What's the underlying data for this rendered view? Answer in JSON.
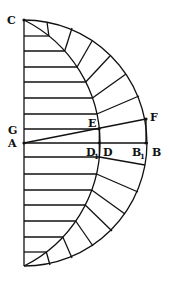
{
  "diagram": {
    "labels": {
      "C": "C",
      "G": "G",
      "A": "A",
      "E": "E",
      "F": "F",
      "D1": "D",
      "D1_sub": "1",
      "D": "D",
      "B1": "B",
      "B1_sub": "1",
      "B": "B"
    },
    "points": {
      "A": [
        24,
        143
      ],
      "C": [
        24,
        20
      ],
      "bottom": [
        24,
        266
      ],
      "B": [
        148,
        143
      ],
      "B1": [
        146,
        143
      ],
      "D": [
        100,
        143
      ],
      "D1": [
        99,
        143
      ],
      "E": [
        99,
        129
      ],
      "F": [
        146,
        119
      ],
      "G": [
        24,
        129
      ]
    },
    "horizontal_lines_top_y": [
      36,
      51,
      67,
      82,
      98,
      114,
      129
    ],
    "horizontal_lines_bottom_y": [
      157,
      174,
      190,
      205,
      221,
      237,
      252
    ],
    "outer_arc": {
      "center": [
        24,
        143
      ],
      "radius": 123
    },
    "inner_arc": {
      "center": [
        -37.5,
        143
      ],
      "radius": 137.5
    }
  }
}
